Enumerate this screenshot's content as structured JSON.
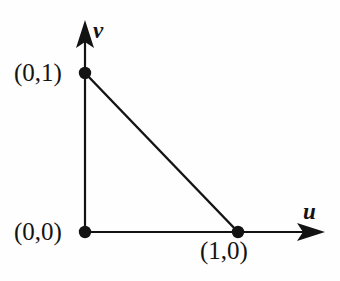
{
  "figure": {
    "type": "reference-triangle-diagram",
    "background_color": "#fefefe",
    "stroke_color": "#131313",
    "width": 340,
    "height": 281
  },
  "axes": {
    "horizontal": {
      "name": "u",
      "label": "u",
      "origin_px": [
        85,
        232
      ],
      "tip_px": [
        325,
        232
      ]
    },
    "vertical": {
      "name": "v",
      "label": "v",
      "origin_px": [
        85,
        232
      ],
      "tip_px": [
        85,
        20
      ]
    }
  },
  "vertices": [
    {
      "name": "origin",
      "label": "(0,0)",
      "coords": [
        0,
        0
      ],
      "px": [
        85,
        232
      ],
      "label_position": "left"
    },
    {
      "name": "unit-u",
      "label": "(1,0)",
      "coords": [
        1,
        0
      ],
      "px": [
        238,
        232
      ],
      "label_position": "below"
    },
    {
      "name": "unit-v",
      "label": "(0,1)",
      "coords": [
        0,
        1
      ],
      "px": [
        85,
        73
      ],
      "label_position": "left"
    }
  ],
  "edges": [
    {
      "name": "leg-v",
      "from": "(0,0)",
      "to": "(0,1)"
    },
    {
      "name": "leg-u",
      "from": "(0,0)",
      "to": "(1,0)"
    },
    {
      "name": "hypotenuse",
      "from": "(0,1)",
      "to": "(1,0)"
    }
  ]
}
